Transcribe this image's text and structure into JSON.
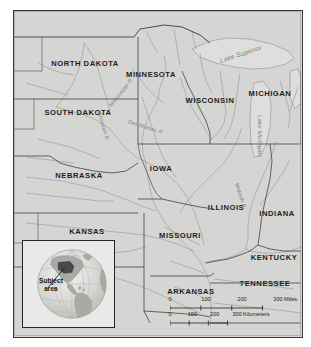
{
  "map": {
    "title": "Upper Mississippi Basin / U.S. Midwest reference map",
    "land_color": "#d5d5d3",
    "border_color": "#3a3a3a",
    "water_label_color": "#7e7e7e",
    "state_label_color": "#1d1d1d",
    "states": [
      {
        "name": "NORTH DAKOTA",
        "x": 85,
        "y": 63
      },
      {
        "name": "SOUTH DAKOTA",
        "x": 78,
        "y": 112
      },
      {
        "name": "NEBRASKA",
        "x": 79,
        "y": 175
      },
      {
        "name": "KANSAS",
        "x": 87,
        "y": 231
      },
      {
        "name": "MINNESOTA",
        "x": 151,
        "y": 74
      },
      {
        "name": "IOWA",
        "x": 161,
        "y": 168
      },
      {
        "name": "MISSOURI",
        "x": 180,
        "y": 235
      },
      {
        "name": "ARKANSAS",
        "x": 191,
        "y": 291
      },
      {
        "name": "WISCONSIN",
        "x": 210,
        "y": 100
      },
      {
        "name": "MICHIGAN",
        "x": 270,
        "y": 93
      },
      {
        "name": "ILLINOIS",
        "x": 226,
        "y": 207
      },
      {
        "name": "INDIANA",
        "x": 277,
        "y": 213
      },
      {
        "name": "KENTUCKY",
        "x": 274,
        "y": 257
      },
      {
        "name": "TENNESSEE",
        "x": 265,
        "y": 283
      }
    ],
    "hydro_labels": [
      {
        "name": "Lake Superior",
        "x": 220,
        "y": 57,
        "rotate": -18,
        "size": 6.6
      },
      {
        "name": "Lake Michigan",
        "x": 260,
        "y": 112,
        "rotate": 90,
        "size": 6.0
      },
      {
        "name": "Mississippi R.",
        "x": 110,
        "y": 103,
        "rotate": -52,
        "size": 5.4
      },
      {
        "name": "Missouri R.",
        "x": 100,
        "y": 110,
        "rotate": 74,
        "size": 5.4
      },
      {
        "name": "Des Moines R.",
        "x": 128,
        "y": 118,
        "rotate": 18,
        "size": 5.4
      },
      {
        "name": "Wabash R.",
        "x": 237,
        "y": 180,
        "rotate": 72,
        "size": 5.2
      }
    ]
  },
  "inset": {
    "label": "Subject\narea",
    "label_line1": "Subject",
    "label_line2": "area",
    "globe_ocean": "#cfcfcd",
    "globe_land": "#a9a9a6",
    "highlight_color": "#4a4a4a"
  },
  "scale": {
    "miles": {
      "ticks": [
        "0",
        "100",
        "200",
        "300"
      ],
      "unit": "Miles",
      "tick_positions": [
        0,
        36,
        72,
        108
      ]
    },
    "kilometers": {
      "ticks": [
        "0",
        "100",
        "200",
        "300"
      ],
      "unit": "Kilometers",
      "tick_positions": [
        0,
        22.4,
        44.7,
        67.1
      ]
    }
  }
}
